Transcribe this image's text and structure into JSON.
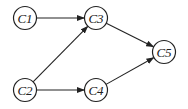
{
  "diagram": {
    "type": "directed-graph",
    "nodes": [
      {
        "id": "C1",
        "label": "C1",
        "x": 25,
        "y": 18
      },
      {
        "id": "C2",
        "label": "C2",
        "x": 25,
        "y": 90
      },
      {
        "id": "C3",
        "label": "C3",
        "x": 96,
        "y": 18
      },
      {
        "id": "C4",
        "label": "C4",
        "x": 96,
        "y": 90
      },
      {
        "id": "C5",
        "label": "C5",
        "x": 164,
        "y": 52
      }
    ],
    "edges": [
      {
        "from": "C1",
        "to": "C3"
      },
      {
        "from": "C2",
        "to": "C3"
      },
      {
        "from": "C2",
        "to": "C4"
      },
      {
        "from": "C3",
        "to": "C5"
      },
      {
        "from": "C4",
        "to": "C5"
      }
    ],
    "colors": {
      "stroke": "#222222",
      "background": "#ffffff"
    }
  }
}
